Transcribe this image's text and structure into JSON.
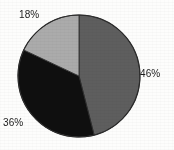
{
  "chart_data": {
    "type": "pie",
    "title": "",
    "subtitle": "",
    "xlabel": "",
    "ylabel": "",
    "grid": false,
    "legend": "none",
    "units": "percent",
    "total": 100,
    "geometry": {
      "center_x": 79,
      "center_y": 76,
      "radius": 61,
      "start_angle_deg": 0,
      "direction": "clockwise"
    },
    "categories": [
      "Slice 1",
      "Slice 2",
      "Slice 3"
    ],
    "values": [
      46,
      36,
      18
    ],
    "labels": [
      "46%",
      "36%",
      "18%"
    ],
    "colors": [
      "#5e5e5e",
      "#0f0f0f",
      "#ababab"
    ],
    "slices": [
      {
        "label": "46%",
        "value": 46,
        "color": "#5e5e5e",
        "start_angle_deg": 0,
        "end_angle_deg": 165.6,
        "label_position": "right"
      },
      {
        "label": "36%",
        "value": 36,
        "color": "#0f0f0f",
        "start_angle_deg": 165.6,
        "end_angle_deg": 295.2,
        "label_position": "bottom-left"
      },
      {
        "label": "18%",
        "value": 18,
        "color": "#ababab",
        "start_angle_deg": 295.2,
        "end_angle_deg": 360,
        "label_position": "top-left"
      }
    ],
    "outline_color": "#2a2a2a",
    "background": "#fdfdfc"
  }
}
